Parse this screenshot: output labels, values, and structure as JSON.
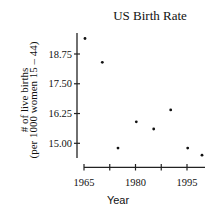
{
  "chart_data": {
    "type": "scatter",
    "title": "US Birth Rate",
    "xlabel": "Year",
    "ylabel": [
      "# of live births",
      "(per 1000 women 15 – 44)"
    ],
    "x": [
      1965,
      1970,
      1975,
      1980,
      1985,
      1990,
      1995,
      1999
    ],
    "series": [
      {
        "name": "Birth rate",
        "values": [
          19.4,
          18.4,
          14.8,
          15.9,
          15.6,
          16.4,
          14.8,
          14.5
        ]
      }
    ],
    "xticks": [
      1965,
      1972.5,
      1980,
      1987.5,
      1995
    ],
    "xtick_labels": [
      "1965",
      "",
      "1980",
      "",
      "1995"
    ],
    "yticks": [
      15.0,
      16.25,
      17.5,
      18.75
    ],
    "ytick_labels": [
      "15.00",
      "16.25",
      "17.50",
      "18.75"
    ],
    "xlim": [
      1965,
      2000
    ],
    "ylim": [
      14.3,
      19.7
    ],
    "grid": false,
    "legend": "none"
  },
  "title": "US Birth Rate",
  "xlabel": "Year",
  "ylabel_line1": "# of live births",
  "ylabel_line2": "(per 1000 women 15 – 44)"
}
